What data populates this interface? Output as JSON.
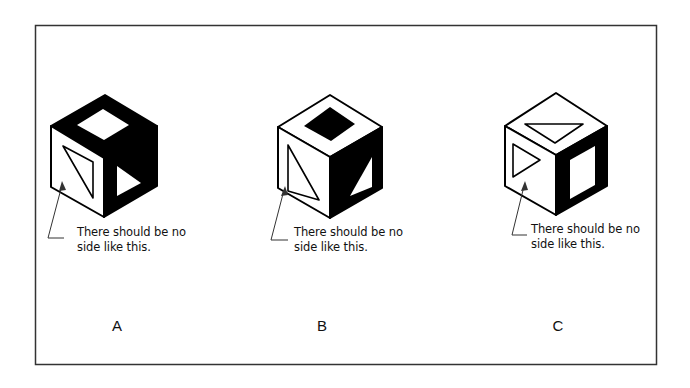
{
  "figure": {
    "border_color": "#333333",
    "panels": [
      {
        "id": "A",
        "label": "A",
        "caption_line1": "There should be no",
        "caption_line2": "side like this.",
        "cube": {
          "top_face": {
            "fill": "black",
            "symbol": "white square (diamond)"
          },
          "left_face": {
            "fill": "white",
            "symbol": "outlined right triangle"
          },
          "right_face": {
            "fill": "black",
            "symbol": "white triangle pointing right"
          }
        }
      },
      {
        "id": "B",
        "label": "B",
        "caption_line1": "There should be no",
        "caption_line2": "side like this.",
        "cube": {
          "top_face": {
            "fill": "white",
            "symbol": "black square (diamond)"
          },
          "left_face": {
            "fill": "white",
            "symbol": "outlined right triangle"
          },
          "right_face": {
            "fill": "black",
            "symbol": "white right triangle"
          }
        }
      },
      {
        "id": "C",
        "label": "C",
        "caption_line1": "There should be no",
        "caption_line2": "side like this.",
        "cube": {
          "top_face": {
            "fill": "white",
            "symbol": "outlined triangle"
          },
          "left_face": {
            "fill": "white",
            "symbol": "outlined triangle pointing right"
          },
          "right_face": {
            "fill": "black",
            "symbol": "white square"
          }
        }
      }
    ]
  }
}
